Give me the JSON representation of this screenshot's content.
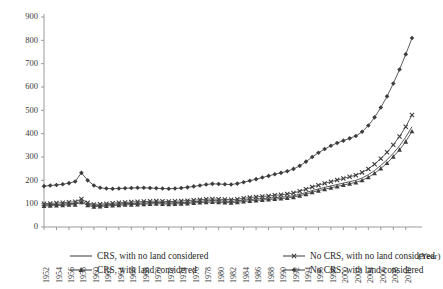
{
  "chart_data": {
    "type": "line",
    "title": "",
    "xlabel": "(Year)",
    "ylabel": "",
    "xlim": [
      1952,
      2011
    ],
    "ylim": [
      0,
      900
    ],
    "ytick_step": 100,
    "xtick_step": 2,
    "grid": false,
    "legend_position": "bottom",
    "x": [
      1952,
      1953,
      1954,
      1955,
      1956,
      1957,
      1958,
      1959,
      1960,
      1961,
      1962,
      1963,
      1964,
      1965,
      1966,
      1967,
      1968,
      1969,
      1970,
      1971,
      1972,
      1973,
      1974,
      1975,
      1976,
      1977,
      1978,
      1979,
      1980,
      1981,
      1982,
      1983,
      1984,
      1985,
      1986,
      1987,
      1988,
      1989,
      1990,
      1991,
      1992,
      1993,
      1994,
      1995,
      1996,
      1997,
      1998,
      1999,
      2000,
      2001,
      2002,
      2003,
      2004,
      2005,
      2006,
      2007,
      2008,
      2009,
      2010,
      2011
    ],
    "yticks": [
      0,
      100,
      200,
      300,
      400,
      500,
      600,
      700,
      800,
      900
    ],
    "xticks": [
      1952,
      1954,
      1956,
      1958,
      1960,
      1962,
      1964,
      1966,
      1968,
      1970,
      1972,
      1974,
      1976,
      1978,
      1980,
      1982,
      1984,
      1986,
      1988,
      1990,
      1992,
      1994,
      1996,
      1998,
      2000,
      2002,
      2004,
      2006,
      2008,
      2010
    ],
    "series": [
      {
        "name": "CRS, with no land considered",
        "marker": "none",
        "values": [
          95,
          96,
          97,
          98,
          100,
          101,
          112,
          98,
          92,
          93,
          95,
          97,
          99,
          100,
          101,
          102,
          103,
          104,
          105,
          104,
          103,
          104,
          105,
          106,
          108,
          110,
          112,
          113,
          112,
          111,
          110,
          112,
          115,
          118,
          120,
          122,
          124,
          126,
          128,
          130,
          134,
          140,
          148,
          156,
          163,
          170,
          176,
          182,
          188,
          194,
          200,
          210,
          224,
          242,
          264,
          288,
          316,
          348,
          385,
          430
        ]
      },
      {
        "name": "No CRS, with no land considered",
        "marker": "x",
        "values": [
          100,
          101,
          103,
          104,
          106,
          108,
          120,
          104,
          97,
          98,
          100,
          102,
          104,
          105,
          107,
          108,
          109,
          110,
          111,
          110,
          109,
          110,
          112,
          113,
          115,
          117,
          119,
          120,
          119,
          118,
          117,
          119,
          123,
          126,
          129,
          131,
          133,
          136,
          138,
          141,
          146,
          153,
          162,
          171,
          179,
          187,
          194,
          201,
          208,
          215,
          222,
          234,
          249,
          269,
          293,
          320,
          352,
          388,
          430,
          480
        ]
      },
      {
        "name": "CRS, with land considered",
        "marker": "triangle",
        "values": [
          90,
          91,
          92,
          93,
          95,
          96,
          106,
          93,
          87,
          88,
          90,
          92,
          93,
          95,
          96,
          97,
          98,
          99,
          100,
          99,
          98,
          99,
          100,
          101,
          103,
          105,
          106,
          107,
          106,
          105,
          104,
          106,
          109,
          112,
          114,
          116,
          118,
          120,
          122,
          124,
          128,
          134,
          141,
          149,
          156,
          162,
          168,
          174,
          180,
          186,
          191,
          200,
          213,
          230,
          251,
          274,
          301,
          331,
          366,
          410
        ]
      },
      {
        "name": "No CRS, with land considered",
        "marker": "diamond",
        "values": [
          175,
          178,
          180,
          183,
          188,
          195,
          232,
          200,
          178,
          168,
          165,
          164,
          165,
          166,
          167,
          168,
          168,
          167,
          166,
          165,
          164,
          165,
          167,
          170,
          174,
          178,
          182,
          185,
          184,
          183,
          182,
          186,
          192,
          198,
          205,
          212,
          219,
          226,
          232,
          239,
          249,
          262,
          280,
          300,
          318,
          334,
          348,
          360,
          370,
          380,
          390,
          408,
          435,
          470,
          512,
          560,
          615,
          675,
          740,
          810
        ]
      }
    ],
    "legend": [
      {
        "label": "CRS, with no land considered",
        "marker": "none"
      },
      {
        "label": "No CRS, with no land considered",
        "marker": "x"
      },
      {
        "label": "CRS, with land considered",
        "marker": "triangle"
      },
      {
        "label": "No CRS, with land considered",
        "marker": "diamond"
      }
    ],
    "colors": {
      "series_stroke": "#3d3d3d",
      "axis": "#9a9a9a",
      "text": "#2b2b2b"
    }
  }
}
